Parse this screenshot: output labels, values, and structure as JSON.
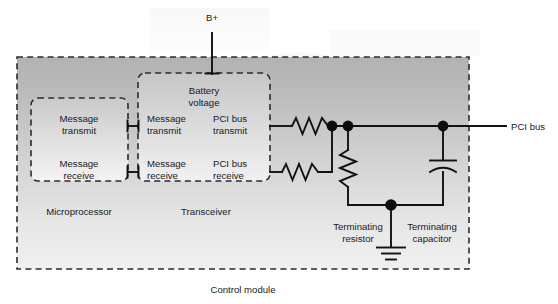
{
  "figure": {
    "type": "block-schematic"
  },
  "labels": {
    "b_plus": "B+",
    "battery_voltage": "Battery\nvoltage",
    "battery_voltage_line1": "Battery",
    "battery_voltage_line2": "voltage",
    "pci_bus": "PCI bus",
    "control_module": "Control module",
    "microprocessor": "Microprocessor",
    "transceiver": "Transceiver",
    "terminating_resistor_line1": "Terminating",
    "terminating_resistor_line2": "resistor",
    "terminating_capacitor_line1": "Terminating",
    "terminating_capacitor_line2": "capacitor"
  },
  "microprocessor": {
    "name": "Microprocessor",
    "ports": [
      {
        "line1": "Message",
        "line2": "transmit"
      },
      {
        "line1": "Message",
        "line2": "receive"
      }
    ]
  },
  "transceiver": {
    "name": "Transceiver",
    "supply_label_line1": "Battery",
    "supply_label_line2": "voltage",
    "inputs": [
      {
        "line1": "Message",
        "line2": "transmit"
      },
      {
        "line1": "Message",
        "line2": "receive"
      }
    ],
    "outputs": [
      {
        "line1": "PCI bus",
        "line2": "transmit"
      },
      {
        "line1": "PCI bus",
        "line2": "receive"
      }
    ]
  },
  "components": [
    {
      "id": "series-resistor-transmit",
      "kind": "resistor",
      "orientation": "horizontal"
    },
    {
      "id": "series-resistor-receive",
      "kind": "resistor",
      "orientation": "horizontal"
    },
    {
      "id": "terminating-resistor",
      "kind": "resistor",
      "orientation": "vertical",
      "label_line1": "Terminating",
      "label_line2": "resistor"
    },
    {
      "id": "terminating-capacitor",
      "kind": "capacitor",
      "orientation": "vertical",
      "label_line1": "Terminating",
      "label_line2": "capacitor"
    },
    {
      "id": "chassis-ground",
      "kind": "ground"
    }
  ],
  "colors": {
    "module_fill_top": "#b5b5b5",
    "module_fill_bottom": "#ececed",
    "inner_box_fill_top": "#cccccc",
    "inner_box_fill_bottom": "#f2f2f2",
    "wire": "#111111",
    "dash_stroke": "#2b2b2b",
    "text": "#1a1a1a",
    "page_background": "#ffffff"
  }
}
